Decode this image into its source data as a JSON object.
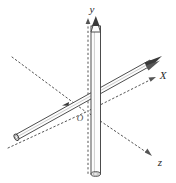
{
  "figure": {
    "background_color": "#ffffff",
    "stroke_color": "#3a3a3a",
    "axis_color": "#555555",
    "rod_fill_color": "#fdfdfd",
    "labels": {
      "y_axis": "y",
      "x_axis": "X",
      "z_axis": "z",
      "origin": "O"
    },
    "axes": [
      {
        "name": "y-axis",
        "label": "y",
        "style": "dashed",
        "direction": "vertical-up",
        "label_x": 92,
        "label_y": 13
      },
      {
        "name": "x-axis",
        "label": "X",
        "style": "dotted",
        "direction": "up-right",
        "label_x": 161,
        "label_y": 78
      },
      {
        "name": "z-axis",
        "label": "z",
        "style": "dotted",
        "direction": "down-right",
        "label_x": 158,
        "label_y": 162
      }
    ],
    "rods": [
      {
        "name": "vertical-rod",
        "along_axis": "y",
        "arrowhead": "top",
        "open_end": "bottom"
      },
      {
        "name": "slanted-rod",
        "along_axis": "x",
        "arrowhead": "upper-right",
        "open_end": "lower-left"
      }
    ],
    "origin": {
      "label": "O",
      "x": 80,
      "y": 118
    }
  }
}
